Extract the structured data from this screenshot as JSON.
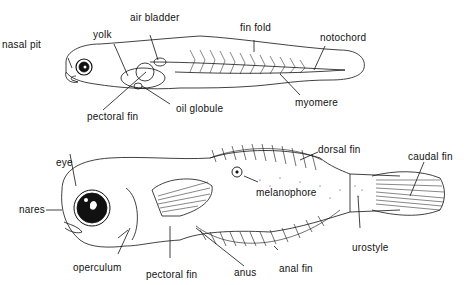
{
  "diagram": {
    "colors": {
      "ink": "#111111",
      "background": "#ffffff"
    },
    "top_figure": {
      "name": "yolk-sac larva",
      "labels": [
        {
          "id": "nasal_pit",
          "text": "nasal pit",
          "x": 2,
          "y": 40
        },
        {
          "id": "yolk",
          "text": "yolk",
          "x": 93,
          "y": 30
        },
        {
          "id": "air_bladder",
          "text": "air bladder",
          "x": 130,
          "y": 13
        },
        {
          "id": "fin_fold",
          "text": "fin fold",
          "x": 240,
          "y": 23
        },
        {
          "id": "notochord",
          "text": "notochord",
          "x": 320,
          "y": 33
        },
        {
          "id": "pectoral_fin",
          "text": "pectoral fin",
          "x": 87,
          "y": 112
        },
        {
          "id": "oil_globule",
          "text": "oil globule",
          "x": 176,
          "y": 104
        },
        {
          "id": "myomere",
          "text": "myomere",
          "x": 295,
          "y": 98
        }
      ]
    },
    "bottom_figure": {
      "name": "post-larva",
      "labels": [
        {
          "id": "eye",
          "text": "eye",
          "x": 56,
          "y": 158
        },
        {
          "id": "nares",
          "text": "nares",
          "x": 19,
          "y": 205
        },
        {
          "id": "operculum",
          "text": "operculum",
          "x": 73,
          "y": 263
        },
        {
          "id": "pectoral_fin",
          "text": "pectoral fin",
          "x": 146,
          "y": 270
        },
        {
          "id": "anus",
          "text": "anus",
          "x": 234,
          "y": 268
        },
        {
          "id": "anal_fin",
          "text": "anal fin",
          "x": 279,
          "y": 264
        },
        {
          "id": "melanophore",
          "text": "melanophore",
          "x": 256,
          "y": 188
        },
        {
          "id": "dorsal_fin",
          "text": "dorsal fin",
          "x": 318,
          "y": 145
        },
        {
          "id": "caudal_fin",
          "text": "caudal fin",
          "x": 408,
          "y": 152
        },
        {
          "id": "urostyle",
          "text": "urostyle",
          "x": 352,
          "y": 243
        }
      ]
    }
  }
}
